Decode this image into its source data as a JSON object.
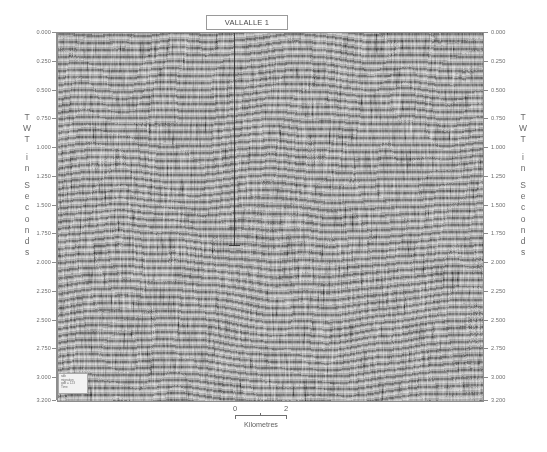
{
  "title": {
    "label": "VALLALLE 1"
  },
  "panel": {
    "well_name": "VALLALLE 1",
    "well_track_label": "well-track"
  },
  "axis": {
    "title_letters": [
      "T",
      "W",
      "T",
      "",
      "i",
      "n",
      "",
      "S",
      "e",
      "c",
      "o",
      "n",
      "d",
      "s"
    ],
    "title_text": "TWT in Seconds",
    "unit": "Seconds",
    "tick_labels": [
      "0.000",
      "0.250",
      "0.500",
      "0.750",
      "1.000",
      "1.250",
      "1.500",
      "1.750",
      "2.000",
      "2.250",
      "2.500",
      "2.750",
      "3.000",
      "3.200"
    ],
    "tick_values": [
      0.0,
      0.25,
      0.5,
      0.75,
      1.0,
      1.25,
      1.5,
      1.75,
      2.0,
      2.25,
      2.5,
      2.75,
      3.0,
      3.2
    ],
    "range": [
      0.0,
      3.2
    ]
  },
  "scale": {
    "start_label": "0",
    "end_label": "2",
    "unit_label": "Kilometres",
    "length_km": 2
  },
  "info_stamp": {
    "line1": "sdb",
    "line2": "migration",
    "line3": "gdb = 123",
    "line4": "Time"
  },
  "chart_data": {
    "type": "heatmap",
    "title": "VALLALLE 1",
    "xlabel": "Kilometres",
    "ylabel": "TWT in Seconds",
    "ylim": [
      0.0,
      3.2
    ],
    "yticks": [
      0.0,
      0.25,
      0.5,
      0.75,
      1.0,
      1.25,
      1.5,
      1.75,
      2.0,
      2.25,
      2.5,
      2.75,
      3.0,
      3.2
    ],
    "ytick_labels": [
      "0.000",
      "0.250",
      "0.500",
      "0.750",
      "1.000",
      "1.250",
      "1.500",
      "1.750",
      "2.000",
      "2.250",
      "2.500",
      "2.750",
      "3.000",
      "3.200"
    ],
    "xlim_km": [
      0,
      2
    ],
    "xticks_km": [
      0,
      2
    ],
    "grid": false,
    "legend": null,
    "colormap": "greyscale",
    "annotations": [
      {
        "type": "well-track",
        "label": "VALLALLE 1",
        "x_km": 1.12,
        "top_s": 0.0,
        "bottom_s": 1.86
      }
    ]
  }
}
